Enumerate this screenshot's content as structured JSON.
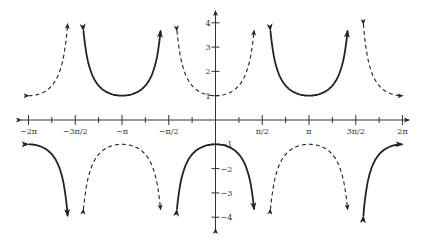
{
  "chart_data": {
    "type": "line",
    "title": "",
    "xlabel": "",
    "ylabel": "",
    "xlim": [
      -6.2832,
      6.2832
    ],
    "ylim": [
      -4,
      4
    ],
    "grid": false,
    "legend": null,
    "x_ticks": [
      {
        "value": -6.2832,
        "label": "−2π"
      },
      {
        "value": -4.7124,
        "label": "−3π/2"
      },
      {
        "value": -3.1416,
        "label": "−π"
      },
      {
        "value": -1.5708,
        "label": "−π/2"
      },
      {
        "value": 1.5708,
        "label": "π/2"
      },
      {
        "value": 3.1416,
        "label": "π"
      },
      {
        "value": 4.7124,
        "label": "3π/2"
      },
      {
        "value": 6.2832,
        "label": "2π"
      }
    ],
    "x_minor_ticks": [
      -5.4978,
      -3.927,
      -2.3562,
      -0.7854,
      0.7854,
      2.3562,
      3.927,
      5.4978
    ],
    "y_ticks": [
      {
        "value": 4,
        "label": "4"
      },
      {
        "value": 3,
        "label": "3"
      },
      {
        "value": 2,
        "label": "2"
      },
      {
        "value": 1,
        "label": "1"
      },
      {
        "value": -1,
        "label": "−1"
      },
      {
        "value": -2,
        "label": "−2"
      },
      {
        "value": -3,
        "label": "−3"
      },
      {
        "value": -4,
        "label": "−4"
      }
    ],
    "series": [
      {
        "name": "y = -sec(x)",
        "style": "solid",
        "color": "#222222",
        "function": "-sec(x)"
      },
      {
        "name": "y = sec(x)",
        "style": "dashed",
        "color": "#222222",
        "function": "sec(x)"
      }
    ]
  },
  "colors": {
    "axis": "#333333",
    "curve": "#222222",
    "background": "#ffffff"
  }
}
